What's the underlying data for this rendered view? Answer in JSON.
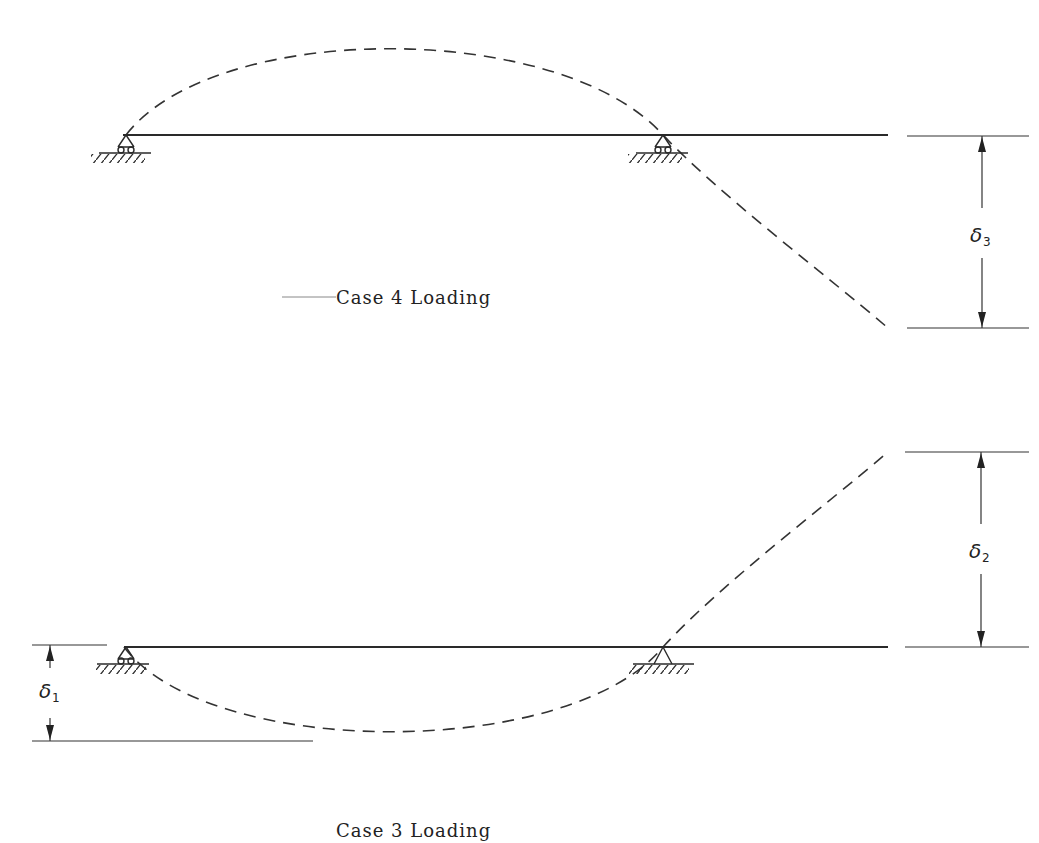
{
  "diagram": {
    "type": "structural-beam-deflection",
    "case4": {
      "label": "Case 4 Loading",
      "beam": {
        "x1": 123,
        "x2": 888,
        "y": 135
      },
      "supports": [
        {
          "type": "roller",
          "x": 126,
          "y": 135
        },
        {
          "type": "roller",
          "x": 663,
          "y": 135
        }
      ],
      "deflected_shape": "upward arch between supports, cantilever deflects downward",
      "dimension": {
        "symbol": "δ",
        "subscript": "3",
        "y_top": 136,
        "y_bottom": 328,
        "x": 982
      }
    },
    "case3": {
      "label": "Case 3 Loading",
      "beam": {
        "x1": 124,
        "x2": 888,
        "y": 647
      },
      "supports": [
        {
          "type": "roller",
          "x": 124,
          "y": 647
        },
        {
          "type": "pin",
          "x": 663,
          "y": 647
        }
      ],
      "deflected_shape": "downward sag between supports, cantilever deflects upward",
      "dimensions": [
        {
          "symbol": "δ",
          "subscript": "1",
          "y_top": 645,
          "y_bottom": 741,
          "x": 50
        },
        {
          "symbol": "δ",
          "subscript": "2",
          "y_top": 452,
          "y_bottom": 647,
          "x": 981
        }
      ]
    }
  },
  "labels": {
    "case4": "Case 4 Loading",
    "case3": "Case 3 Loading",
    "delta": "δ",
    "sub1": "1",
    "sub2": "2",
    "sub3": "3"
  },
  "colors": {
    "line": "#2a2a2a",
    "background": "#ffffff"
  }
}
